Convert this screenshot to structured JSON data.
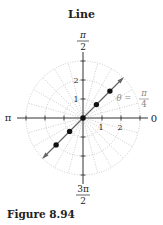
{
  "title": "Line",
  "caption": "Figure 8.94",
  "diagram": {
    "type": "polar-plot",
    "center": {
      "x": 83,
      "y": 118
    },
    "unit_px": 19,
    "max_radius": 3,
    "angle_labels": {
      "top": {
        "num": "π",
        "den": "2"
      },
      "bottom": {
        "num": "3π",
        "den": "2"
      },
      "left": "π",
      "right": "0"
    },
    "radial_tick_labels": [
      "1",
      "2"
    ],
    "vertical_tick_labels": [
      "1",
      "2"
    ],
    "line_label": {
      "theta": "θ =",
      "num": "π",
      "den": "4"
    },
    "points": [
      {
        "r": -2,
        "theta": "π/4"
      },
      {
        "r": -1,
        "theta": "π/4"
      },
      {
        "r": 0,
        "theta": "π/4"
      },
      {
        "r": 1,
        "theta": "π/4"
      },
      {
        "r": 2,
        "theta": "π/4"
      }
    ],
    "colors": {
      "axis": "#333333",
      "grid": "#aaaaaa",
      "line": "#666666",
      "point": "#111111",
      "label_gray": "#888888"
    }
  }
}
